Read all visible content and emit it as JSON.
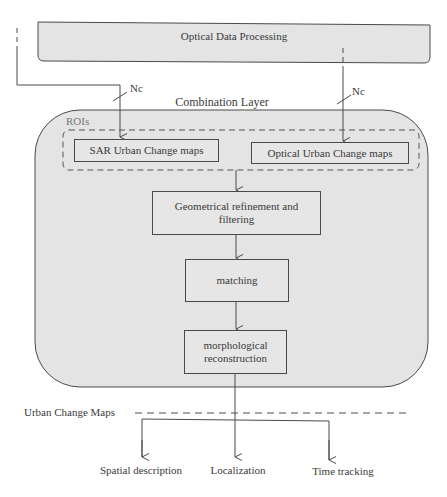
{
  "diagram": {
    "top_block": {
      "label": "Optical Data Processing"
    },
    "inputs": [
      {
        "label": "Nc",
        "target": "SAR Urban Change maps"
      },
      {
        "label": "Nc",
        "target": "Optical Urban Change maps"
      }
    ],
    "combination_layer": {
      "title": "Combination Layer",
      "roi_group": {
        "label": "ROIs",
        "boxes": [
          {
            "label": "SAR Urban Change maps"
          },
          {
            "label": "Optical Urban Change maps"
          }
        ]
      },
      "steps": [
        {
          "label": "Geometrical refinement and filtering"
        },
        {
          "label": "matching"
        },
        {
          "label": "morphological reconstruction"
        }
      ]
    },
    "output_separator": {
      "label": "Urban Change Maps"
    },
    "outputs": [
      {
        "label": "Spatial description"
      },
      {
        "label": "Localization"
      },
      {
        "label": "Time tracking"
      }
    ],
    "colors": {
      "block_fill": "#e4e4e4",
      "stroke": "#4a4a4a",
      "text": "#3a3a3a"
    }
  }
}
